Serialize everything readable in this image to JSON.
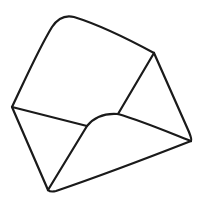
{
  "image": {
    "subject": "open envelope line drawing",
    "icon": "envelope-open-icon",
    "stroke_color": "#1a1a1a",
    "background_color": "#ffffff"
  }
}
